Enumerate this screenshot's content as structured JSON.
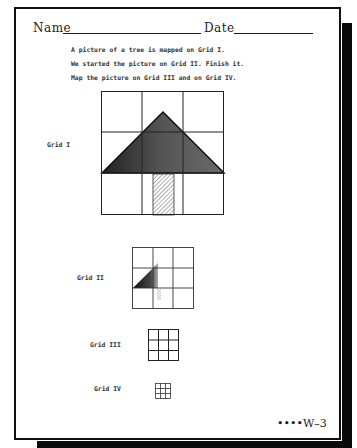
{
  "header": {
    "name_label": "Name",
    "date_label": "Date"
  },
  "instructions": [
    "A picture of a tree is mapped on Grid I.",
    "We started the picture on Grid II.  Finish it.",
    "Map the picture on Grid III and on Grid IV."
  ],
  "grids": [
    {
      "label": "Grid I",
      "rows": 3,
      "cols": 3,
      "content": "tree: shaded triangle crown spanning middle row, hatched trunk in bottom-center cell"
    },
    {
      "label": "Grid II",
      "rows": 3,
      "cols": 3,
      "content": "partial tree: left half of crown started, small trunk stub"
    },
    {
      "label": "Grid III",
      "rows": 3,
      "cols": 3,
      "content": "empty"
    },
    {
      "label": "Grid IV",
      "rows": 3,
      "cols": 3,
      "content": "empty"
    }
  ],
  "footer": {
    "page_marker": "••••W–3"
  },
  "colors": {
    "ink": "#111111",
    "crown_fill": "#555555"
  }
}
